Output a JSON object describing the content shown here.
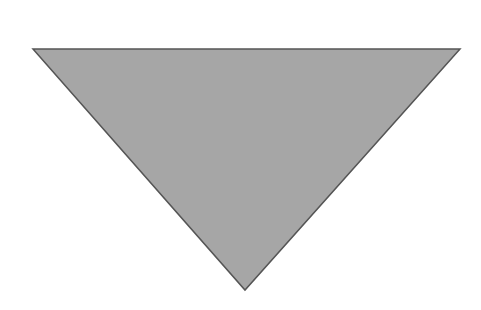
{
  "diagram": {
    "background": "#ffffff",
    "shape": {
      "type": "inverted-triangle",
      "points": [
        [
          33,
          49
        ],
        [
          460,
          49
        ],
        [
          245,
          290
        ]
      ],
      "fill": "#a6a6a6",
      "stroke": "#555555",
      "stroke_width": 1.5
    }
  }
}
